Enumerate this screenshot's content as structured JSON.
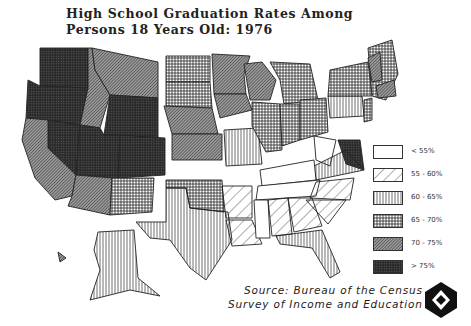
{
  "title": {
    "line1": "High School Graduation Rates Among",
    "line2": "Persons 18 Years Old: 1976"
  },
  "legend": {
    "items": [
      {
        "label": "< 55%",
        "pattern": "blank"
      },
      {
        "label": "55 - 60%",
        "pattern": "sparse-diagonal"
      },
      {
        "label": "60 - 65%",
        "pattern": "vertical-lines"
      },
      {
        "label": "65 - 70%",
        "pattern": "grid"
      },
      {
        "label": "70 - 75%",
        "pattern": "dense-diagonal"
      },
      {
        "label": "> 75%",
        "pattern": "dense-grid"
      }
    ]
  },
  "source": {
    "line1": "Source: Bureau of the Census",
    "line2": "Survey of Income and Education"
  },
  "logo": {
    "icon": "hexagon-cube-logo"
  },
  "colors": {
    "ink": "#1a1a1a",
    "background": "#ffffff"
  }
}
